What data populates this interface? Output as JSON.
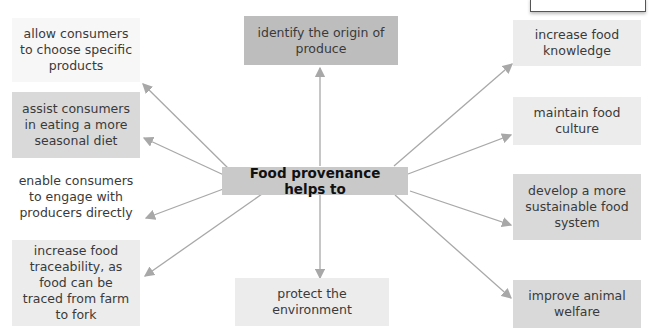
{
  "center": {
    "label": "Food provenance helps to"
  },
  "nodes": {
    "allow": "allow consumers to choose specific products",
    "assist": "assist consumers in eating a more seasonal diet",
    "enable": "enable consumers to engage with producers directly",
    "traceability": "increase food traceability, as food can be traced from farm to fork",
    "origin": "identify the origin of produce",
    "protect": "protect the environment",
    "knowledge": "increase food knowledge",
    "culture": "maintain food culture",
    "sustainable": "develop a more sustainable food system",
    "animal": "improve animal welfare"
  },
  "colors": {
    "arrow": "#a8a8a8",
    "center_bg": "#c9c9c9",
    "dark_box": "#bdbdbd",
    "mid_box": "#d9d9d9",
    "light_box": "#ececec"
  }
}
